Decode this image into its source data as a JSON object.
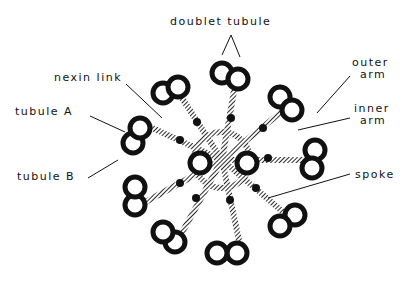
{
  "diagram": {
    "labels": {
      "doublet_tubule": "doublet tubule",
      "nexin_link": "nexin link",
      "tubule_a": "tubule A",
      "tubule_b": "tubule B",
      "outer_arm_1": "outer",
      "outer_arm_2": "arm",
      "inner_arm_1": "inner",
      "inner_arm_2": "arm",
      "spoke": "spoke"
    },
    "colors": {
      "ink": "#111111",
      "background": "#ffffff"
    }
  }
}
